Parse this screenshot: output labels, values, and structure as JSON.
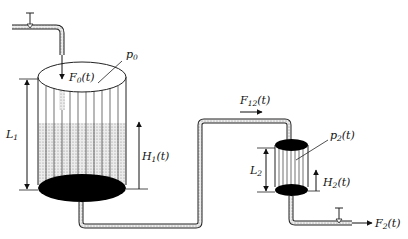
{
  "diagram": {
    "type": "two-tank hydraulic system",
    "labels": {
      "p0": "p",
      "p0_sub": "0",
      "F0": "F",
      "F0_sub": "0",
      "F0_arg": "(t)",
      "L1": "L",
      "L1_sub": "1",
      "H1": "H",
      "H1_sub": "1",
      "H1_arg": "(t)",
      "F12": "F",
      "F12_sub": "12",
      "F12_arg": "(t)",
      "p2": "p",
      "p2_sub": "2",
      "p2_arg": "(t)",
      "L2": "L",
      "L2_sub": "2",
      "H2": "H",
      "H2_sub": "2",
      "H2_arg": "(t)",
      "F2": "F",
      "F2_sub": "2",
      "F2_arg": "(t)"
    },
    "colors": {
      "line": "#222222",
      "fill_liquid": "#d8d8d8",
      "bottom": "#000000"
    }
  }
}
